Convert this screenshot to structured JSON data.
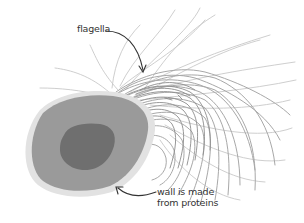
{
  "diagram": {
    "labels": {
      "flagella": "flagella",
      "wall_line1": "wall is made",
      "wall_line2": "from proteins"
    },
    "colors": {
      "background": "#ffffff",
      "cell_wall": "#e2e2e2",
      "cytoplasm": "#9a9a9a",
      "nucleus": "#6f6f6f",
      "flagella": "#9c9c9c",
      "flagella_light": "#c4c4c4",
      "arrow": "#333333",
      "text": "#333333"
    }
  }
}
